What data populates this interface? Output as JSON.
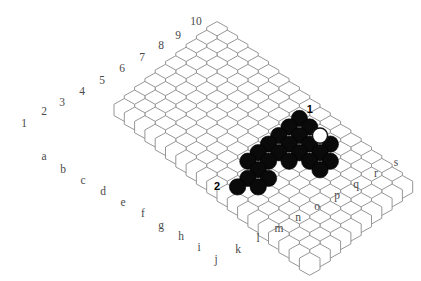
{
  "board": {
    "title": "Hex board diagram",
    "type": "hex-rhombus",
    "columns": 19,
    "rows": 10,
    "column_labels": [
      "a",
      "b",
      "c",
      "d",
      "e",
      "f",
      "g",
      "h",
      "i",
      "j",
      "k",
      "l",
      "m",
      "n",
      "o",
      "p",
      "q",
      "r",
      "s"
    ],
    "row_labels": [
      "1",
      "2",
      "3",
      "4",
      "5",
      "6",
      "7",
      "8",
      "9",
      "10"
    ],
    "colors": {
      "cell_fill": "#ffffff",
      "cell_stroke": "#8a8a8a",
      "black_stone": "#0a0a0a",
      "white_stone": "#ffffff",
      "label": "#4a4a4a",
      "marker": "#000000",
      "background": "#ffffff"
    },
    "geometry": {
      "hex_width": 20.6,
      "hex_height": 22.8,
      "origin_x": 217.0,
      "origin_y": 33.0,
      "col_dx": 10.3,
      "col_dy": 8.55,
      "row_dx": -10.3,
      "row_dy": 8.55
    },
    "markers": [
      {
        "label": "1",
        "col": 9,
        "row": 0,
        "name": "marker-one"
      },
      {
        "label": "2",
        "col": 9,
        "row": 9,
        "name": "marker-two"
      }
    ],
    "top_left_labels": [
      {
        "text": "1",
        "x": 24,
        "y": 124
      },
      {
        "text": "2",
        "x": 44,
        "y": 112
      },
      {
        "text": "3",
        "x": 62,
        "y": 103
      },
      {
        "text": "4",
        "x": 82,
        "y": 92
      },
      {
        "text": "5",
        "x": 102,
        "y": 81
      },
      {
        "text": "6",
        "x": 122,
        "y": 69
      },
      {
        "text": "7",
        "x": 142,
        "y": 58
      },
      {
        "text": "8",
        "x": 161,
        "y": 46
      },
      {
        "text": "9",
        "x": 178,
        "y": 36
      },
      {
        "text": "10",
        "x": 196,
        "y": 22
      }
    ],
    "bottom_left_labels": [
      {
        "text": "a",
        "x": 44,
        "y": 157
      },
      {
        "text": "b",
        "x": 63,
        "y": 170
      },
      {
        "text": "c",
        "x": 83,
        "y": 181
      },
      {
        "text": "d",
        "x": 103,
        "y": 192
      },
      {
        "text": "e",
        "x": 123,
        "y": 203
      },
      {
        "text": "f",
        "x": 143,
        "y": 214
      },
      {
        "text": "g",
        "x": 161,
        "y": 226
      },
      {
        "text": "h",
        "x": 181,
        "y": 237
      },
      {
        "text": "i",
        "x": 199,
        "y": 248
      },
      {
        "text": "j",
        "x": 216,
        "y": 260
      }
    ],
    "bottom_right_labels": [
      {
        "text": "k",
        "x": 238,
        "y": 250
      },
      {
        "text": "l",
        "x": 258,
        "y": 239
      },
      {
        "text": "m",
        "x": 279,
        "y": 229
      },
      {
        "text": "n",
        "x": 298,
        "y": 218
      },
      {
        "text": "o",
        "x": 317,
        "y": 207
      },
      {
        "text": "p",
        "x": 337,
        "y": 196
      },
      {
        "text": "q",
        "x": 356,
        "y": 185
      },
      {
        "text": "r",
        "x": 376,
        "y": 174
      },
      {
        "text": "s",
        "x": 396,
        "y": 163
      }
    ],
    "black_stones": [
      {
        "col": 9,
        "row": 1
      },
      {
        "col": 10,
        "row": 1
      },
      {
        "col": 12,
        "row": 1
      },
      {
        "col": 9,
        "row": 2
      },
      {
        "col": 10,
        "row": 2
      },
      {
        "col": 11,
        "row": 2
      },
      {
        "col": 12,
        "row": 2
      },
      {
        "col": 13,
        "row": 2
      },
      {
        "col": 9,
        "row": 3
      },
      {
        "col": 10,
        "row": 3
      },
      {
        "col": 11,
        "row": 3
      },
      {
        "col": 12,
        "row": 3
      },
      {
        "col": 13,
        "row": 3
      },
      {
        "col": 9,
        "row": 4
      },
      {
        "col": 10,
        "row": 4
      },
      {
        "col": 11,
        "row": 4
      },
      {
        "col": 9,
        "row": 5
      },
      {
        "col": 10,
        "row": 5
      },
      {
        "col": 9,
        "row": 6
      },
      {
        "col": 10,
        "row": 6
      },
      {
        "col": 11,
        "row": 6
      },
      {
        "col": 10,
        "row": 7
      },
      {
        "col": 11,
        "row": 7
      },
      {
        "col": 10,
        "row": 8
      }
    ],
    "white_stones": [
      {
        "col": 11,
        "row": 1
      }
    ]
  }
}
